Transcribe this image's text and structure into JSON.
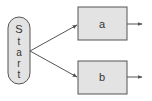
{
  "diagram": {
    "type": "flowchart",
    "start": {
      "label": "Start",
      "letters": [
        "S",
        "t",
        "a",
        "r",
        "t"
      ],
      "shape": "pill-vertical"
    },
    "nodes": [
      {
        "id": "a",
        "label": "a",
        "shape": "rectangle"
      },
      {
        "id": "b",
        "label": "b",
        "shape": "rectangle"
      }
    ],
    "edges": [
      {
        "from": "Start",
        "to": "a"
      },
      {
        "from": "Start",
        "to": "b"
      },
      {
        "from": "a",
        "to": "out"
      },
      {
        "from": "b",
        "to": "out"
      }
    ],
    "colors": {
      "fill": "#e3e3e3",
      "stroke": "#555555",
      "text": "#333333",
      "background": "#ffffff"
    }
  }
}
